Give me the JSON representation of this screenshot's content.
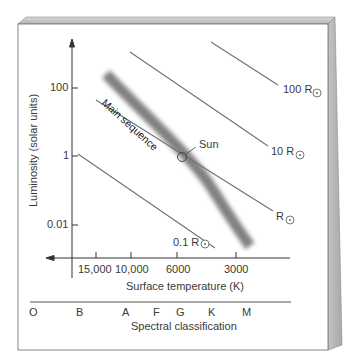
{
  "diagram": {
    "y_axis": {
      "label": "Luminosity (solar units)",
      "ticks": [
        {
          "label": "100",
          "y": 88
        },
        {
          "label": "1",
          "y": 156
        },
        {
          "label": "0.01",
          "y": 225
        }
      ]
    },
    "x_axis": {
      "label": "Surface temperature (K)",
      "ticks": [
        {
          "label": "15,000",
          "x": 96
        },
        {
          "label": "10,000",
          "x": 131
        },
        {
          "label": "6000",
          "x": 177
        },
        {
          "label": "3000",
          "x": 236
        }
      ]
    },
    "spectral": {
      "label": "Spectral classification",
      "classes": [
        {
          "label": "O",
          "x": 33
        },
        {
          "label": "B",
          "x": 80
        },
        {
          "label": "A",
          "x": 126
        },
        {
          "label": "F",
          "x": 157
        },
        {
          "label": "G",
          "x": 180
        },
        {
          "label": "K",
          "x": 212
        },
        {
          "label": "M",
          "x": 247
        }
      ]
    },
    "radius_lines": [
      {
        "label": "100 R",
        "x1": 211,
        "y1": 42,
        "x2": 278,
        "y2": 85,
        "lx": 283,
        "ly": 85,
        "cx": 317,
        "cy": 93
      },
      {
        "label": "10 R",
        "x1": 130,
        "y1": 52,
        "x2": 268,
        "y2": 146,
        "lx": 271,
        "ly": 146,
        "cx": 300,
        "cy": 155
      },
      {
        "label": "R",
        "x1": 96,
        "y1": 100,
        "x2": 273,
        "y2": 211,
        "lx": 276,
        "ly": 212,
        "cx": 290,
        "cy": 220
      },
      {
        "label": "0.1 R",
        "x1": 78,
        "y1": 154,
        "x2": 215,
        "y2": 248,
        "lx": 173,
        "ly": 238,
        "cx": 205,
        "cy": 244
      }
    ],
    "main_sequence_label": "Main sequence",
    "sun_label": "Sun",
    "colors": {
      "frame_edge": "#bdbdbd",
      "line": "#6e6e6e",
      "band": "#808080",
      "text": "#3a3a3a"
    }
  }
}
